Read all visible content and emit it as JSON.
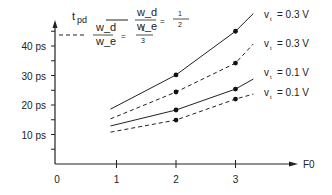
{
  "chart_data": {
    "type": "line",
    "title": "",
    "ylabel": "t_pd",
    "xlabel": "F0",
    "xlim": [
      0,
      3.6
    ],
    "ylim": [
      0,
      50
    ],
    "grid": false,
    "x_ticks": [
      "0",
      "1",
      "2",
      "3"
    ],
    "y_ticks": [
      "10 ps",
      "20 ps",
      "30 ps",
      "40 ps"
    ],
    "legend": {
      "solid": {
        "label_top": "w_d",
        "label_bottom": "w_e",
        "equals": "=",
        "value_num": "1",
        "value_den": "2"
      },
      "dashed": {
        "label_top": "w_d",
        "label_bottom": "w_e",
        "equals": "=",
        "value_num": "1",
        "value_den": "3"
      }
    },
    "series": [
      {
        "name": "v_t = 0.3 V (wd/we = 1/2)",
        "style": "solid",
        "label": "v_t = 0.3 V",
        "x": [
          0.9,
          2,
          3,
          3.3
        ],
        "values": [
          18.6,
          30.2,
          45,
          51
        ],
        "markers_at": [
          2,
          3
        ]
      },
      {
        "name": "v_t = 0.3 V (wd/we = 1/3)",
        "style": "dashed",
        "label": "v_t = 0.3 V",
        "x": [
          0.9,
          2,
          3,
          3.3
        ],
        "values": [
          15.3,
          24.4,
          34.2,
          40.7
        ],
        "markers_at": [
          2,
          3
        ]
      },
      {
        "name": "v_t = 0.1 V (wd/we = 1/2)",
        "style": "solid",
        "label": "v_t = 0.1 V",
        "x": [
          0.9,
          2,
          3,
          3.3
        ],
        "values": [
          12.9,
          18.3,
          25.4,
          28.8
        ],
        "markers_at": [
          2,
          3
        ]
      },
      {
        "name": "v_t = 0.1 V (wd/we = 1/3)",
        "style": "dashed",
        "label": "v_t = 0.1 V",
        "x": [
          0.9,
          2,
          3,
          3.3
        ],
        "values": [
          10.8,
          14.9,
          22,
          23.7
        ],
        "markers_at": [
          2,
          3
        ]
      }
    ]
  },
  "axis": {
    "y_label_main": "t",
    "y_label_sub": "pd",
    "x_label": "F0"
  }
}
